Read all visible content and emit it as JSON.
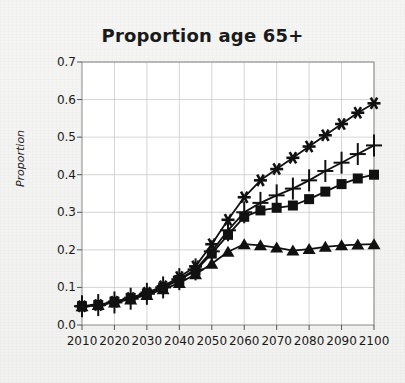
{
  "chart_data": {
    "type": "line",
    "title": "Proportion age 65+",
    "xlabel": "",
    "ylabel": "Proportion",
    "xlim": [
      2010,
      2100
    ],
    "ylim": [
      0.0,
      0.7
    ],
    "ytick_labels": [
      "0.0",
      "0.1",
      "0.2",
      "0.3",
      "0.4",
      "0.5",
      "0.6",
      "0.7"
    ],
    "ytick_values": [
      0.0,
      0.1,
      0.2,
      0.3,
      0.4,
      0.5,
      0.6,
      0.7
    ],
    "xtick_labels": [
      "2010",
      "2020",
      "2030",
      "2040",
      "2050",
      "2060",
      "2070",
      "2080",
      "2090",
      "2100"
    ],
    "xtick_values": [
      2010,
      2020,
      2030,
      2040,
      2050,
      2060,
      2070,
      2080,
      2090,
      2100
    ],
    "grid": true,
    "legend": "none",
    "line_color": "#111111",
    "x": [
      2010,
      2015,
      2020,
      2025,
      2030,
      2035,
      2040,
      2045,
      2050,
      2055,
      2060,
      2065,
      2070,
      2075,
      2080,
      2085,
      2090,
      2095,
      2100
    ],
    "series": [
      {
        "name": "series-asterisk",
        "marker": "asterisk",
        "values": [
          0.05,
          0.053,
          0.062,
          0.072,
          0.086,
          0.103,
          0.128,
          0.156,
          0.215,
          0.28,
          0.34,
          0.385,
          0.415,
          0.445,
          0.475,
          0.505,
          0.535,
          0.565,
          0.59
        ]
      },
      {
        "name": "series-plus",
        "marker": "plus",
        "values": [
          0.05,
          0.053,
          0.06,
          0.07,
          0.083,
          0.1,
          0.122,
          0.148,
          0.196,
          0.252,
          0.3,
          0.325,
          0.345,
          0.363,
          0.385,
          0.41,
          0.432,
          0.455,
          0.478
        ]
      },
      {
        "name": "series-square",
        "marker": "square",
        "values": [
          0.05,
          0.053,
          0.062,
          0.072,
          0.084,
          0.1,
          0.12,
          0.145,
          0.19,
          0.24,
          0.288,
          0.305,
          0.312,
          0.318,
          0.335,
          0.355,
          0.375,
          0.39,
          0.4
        ]
      },
      {
        "name": "series-triangle",
        "marker": "triangle",
        "values": [
          0.05,
          0.053,
          0.06,
          0.068,
          0.08,
          0.095,
          0.112,
          0.135,
          0.163,
          0.195,
          0.215,
          0.212,
          0.206,
          0.198,
          0.202,
          0.208,
          0.212,
          0.214,
          0.215
        ]
      }
    ]
  }
}
